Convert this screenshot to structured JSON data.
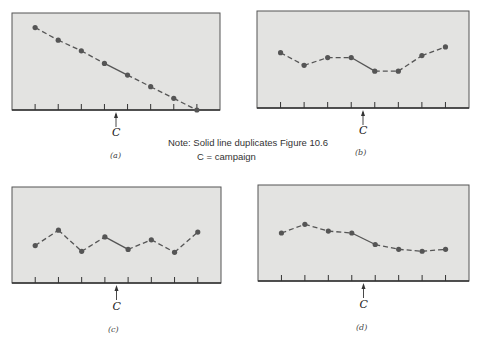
{
  "figure": {
    "note_line1": "Note: Solid line duplicates Figure 10.6",
    "note_line2": "C = campaign"
  },
  "colors": {
    "panel_fill": "#e3e3e1",
    "line": "#555555",
    "axis": "#333333"
  },
  "chart_data": [
    {
      "type": "line",
      "panel_label": "(a)",
      "marker_label": "C",
      "marker_position": 4.5,
      "x": [
        1,
        2,
        3,
        4,
        5,
        6,
        7,
        8
      ],
      "series": [
        {
          "name": "sales",
          "values": [
            85,
            72,
            61,
            48,
            36,
            24,
            12,
            0
          ]
        }
      ],
      "solid_segments": [
        [
          4,
          5
        ]
      ],
      "ylim": [
        0,
        100
      ],
      "xlim": [
        0,
        9
      ],
      "title": "",
      "xlabel": "",
      "ylabel": "",
      "grid": false
    },
    {
      "type": "line",
      "panel_label": "(b)",
      "marker_label": "C",
      "marker_position": 4.5,
      "x": [
        1,
        2,
        3,
        4,
        5,
        6,
        7,
        8
      ],
      "series": [
        {
          "name": "sales",
          "values": [
            57,
            44,
            52,
            52,
            38,
            38,
            54,
            63
          ]
        }
      ],
      "solid_segments": [
        [
          4,
          5
        ]
      ],
      "ylim": [
        0,
        100
      ],
      "xlim": [
        0,
        9
      ],
      "title": "",
      "xlabel": "",
      "ylabel": "",
      "grid": false
    },
    {
      "type": "line",
      "panel_label": "(c)",
      "marker_label": "C",
      "marker_position": 4.5,
      "x": [
        1,
        2,
        3,
        4,
        5,
        6,
        7,
        8
      ],
      "series": [
        {
          "name": "sales",
          "values": [
            39,
            55,
            33,
            48,
            35,
            45,
            32,
            53
          ]
        }
      ],
      "solid_segments": [
        [
          4,
          5
        ]
      ],
      "ylim": [
        0,
        100
      ],
      "xlim": [
        0,
        9
      ],
      "title": "",
      "xlabel": "",
      "ylabel": "",
      "grid": false
    },
    {
      "type": "line",
      "panel_label": "(d)",
      "marker_label": "C",
      "marker_position": 4.5,
      "x": [
        1,
        2,
        3,
        4,
        5,
        6,
        7,
        8
      ],
      "series": [
        {
          "name": "sales",
          "values": [
            50,
            59,
            52,
            50,
            38,
            33,
            31,
            33
          ]
        }
      ],
      "solid_segments": [
        [
          4,
          5
        ]
      ],
      "ylim": [
        0,
        100
      ],
      "xlim": [
        0,
        9
      ],
      "title": "",
      "xlabel": "",
      "ylabel": "",
      "grid": false
    }
  ]
}
